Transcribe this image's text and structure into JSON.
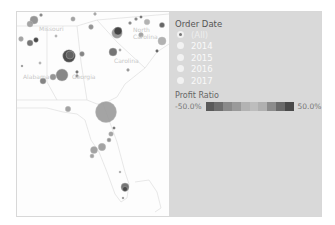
{
  "map": {
    "labels": [
      {
        "text": "Missouri",
        "x": 22,
        "y": 13
      },
      {
        "text": "North Carolina",
        "x": 116,
        "y": 14
      },
      {
        "text": "Carolina",
        "x": 97,
        "y": 45
      },
      {
        "text": "Alabama",
        "x": 6,
        "y": 61
      },
      {
        "text": "Georgia",
        "x": 55,
        "y": 61
      }
    ],
    "bubbles": [
      {
        "cx": 17,
        "cy": 8,
        "r": 4,
        "color": "#8a8a8a"
      },
      {
        "cx": 13,
        "cy": 12,
        "r": 3,
        "color": "#9b9b9b"
      },
      {
        "cx": 24,
        "cy": 3,
        "r": 1.5,
        "color": "#777"
      },
      {
        "cx": 56,
        "cy": 7,
        "r": 2.2,
        "color": "#999"
      },
      {
        "cx": 78,
        "cy": 2,
        "r": 1.4,
        "color": "#999"
      },
      {
        "cx": 4,
        "cy": 27,
        "r": 2.4,
        "color": "#999"
      },
      {
        "cx": 13,
        "cy": 31,
        "r": 3,
        "color": "#666"
      },
      {
        "cx": 19,
        "cy": 28,
        "r": 2.4,
        "color": "#333"
      },
      {
        "cx": 39,
        "cy": 24,
        "r": 1.2,
        "color": "#aaa"
      },
      {
        "cx": 74,
        "cy": 15,
        "r": 2.4,
        "color": "#888"
      },
      {
        "cx": 100,
        "cy": 21,
        "r": 5.2,
        "color": "#8e8e8e"
      },
      {
        "cx": 101,
        "cy": 19,
        "r": 4,
        "color": "#3a3a3a"
      },
      {
        "cx": 113,
        "cy": 11,
        "r": 1.5,
        "color": "#777"
      },
      {
        "cx": 119,
        "cy": 7,
        "r": 1.5,
        "color": "#777"
      },
      {
        "cx": 124,
        "cy": 5,
        "r": 1.3,
        "color": "#555"
      },
      {
        "cx": 130,
        "cy": 10,
        "r": 2.8,
        "color": "#aaa"
      },
      {
        "cx": 145,
        "cy": 13,
        "r": 2.6,
        "color": "#555"
      },
      {
        "cx": 124,
        "cy": 23,
        "r": 2.4,
        "color": "#999"
      },
      {
        "cx": 145,
        "cy": 29,
        "r": 4,
        "color": "#aaa"
      },
      {
        "cx": 140,
        "cy": 39,
        "r": 1.4,
        "color": "#444"
      },
      {
        "cx": 103,
        "cy": 38,
        "r": 1.2,
        "color": "#999"
      },
      {
        "cx": 96,
        "cy": 40,
        "r": 4,
        "color": "#666"
      },
      {
        "cx": 52,
        "cy": 44,
        "r": 6.3,
        "color": "#3a3a3a"
      },
      {
        "cx": 53,
        "cy": 43,
        "r": 4,
        "color": "#666"
      },
      {
        "cx": 65,
        "cy": 42,
        "r": 2.4,
        "color": "#777"
      },
      {
        "cx": 23,
        "cy": 51,
        "r": 1.2,
        "color": "#aaa"
      },
      {
        "cx": 5,
        "cy": 54,
        "r": 1,
        "color": "#666"
      },
      {
        "cx": 45,
        "cy": 63,
        "r": 6,
        "color": "#7a7a7a"
      },
      {
        "cx": 36,
        "cy": 65,
        "r": 3,
        "color": "#8a8a8a"
      },
      {
        "cx": 60,
        "cy": 60,
        "r": 1.4,
        "color": "#555"
      },
      {
        "cx": 60,
        "cy": 64,
        "r": 1.4,
        "color": "#777"
      },
      {
        "cx": 26,
        "cy": 69,
        "r": 3,
        "color": "#777"
      },
      {
        "cx": 111,
        "cy": 58,
        "r": 1.4,
        "color": "#888"
      },
      {
        "cx": 51,
        "cy": 97,
        "r": 2.7,
        "color": "#999"
      },
      {
        "cx": 89,
        "cy": 100,
        "r": 10.5,
        "color": "#9a9a9a"
      },
      {
        "cx": 97,
        "cy": 116,
        "r": 1.3,
        "color": "#555"
      },
      {
        "cx": 94,
        "cy": 122,
        "r": 2.3,
        "color": "#999"
      },
      {
        "cx": 92,
        "cy": 128,
        "r": 2,
        "color": "#888"
      },
      {
        "cx": 85,
        "cy": 135,
        "r": 3.7,
        "color": "#999"
      },
      {
        "cx": 77,
        "cy": 138,
        "r": 3.5,
        "color": "#999"
      },
      {
        "cx": 75,
        "cy": 144,
        "r": 2,
        "color": "#999"
      },
      {
        "cx": 103,
        "cy": 160,
        "r": 1,
        "color": "#888"
      },
      {
        "cx": 108,
        "cy": 175,
        "r": 4,
        "color": "#666"
      },
      {
        "cx": 108,
        "cy": 177,
        "r": 2.5,
        "color": "#444"
      },
      {
        "cx": 106,
        "cy": 186,
        "r": 1,
        "color": "#666"
      }
    ]
  },
  "filter": {
    "title": "Order Date",
    "options": [
      {
        "label": "(All)",
        "selected": true
      },
      {
        "label": "2014",
        "selected": false
      },
      {
        "label": "2015",
        "selected": false
      },
      {
        "label": "2016",
        "selected": false
      },
      {
        "label": "2017",
        "selected": false
      }
    ]
  },
  "legend": {
    "title": "Profit Ratio",
    "min_label": "-50.0%",
    "max_label": "50.0%",
    "ramp_colors": [
      "#5a5a5a",
      "#6e6e6e",
      "#8a8a8a",
      "#9a9a9a",
      "#b3b3b3",
      "#bdbdbd",
      "#b0b0b0",
      "#8c8c8c",
      "#6a6a6a",
      "#4a4a4a"
    ]
  }
}
